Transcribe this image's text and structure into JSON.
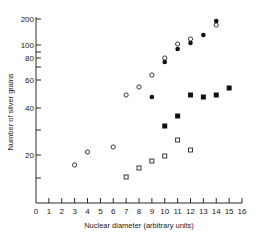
{
  "chart_data": {
    "type": "scatter",
    "title": "",
    "xlabel": "Nuclear diameter (arbitrary units)",
    "ylabel": "Number of silver grains",
    "xlim": [
      0,
      16
    ],
    "x_ticks": [
      0,
      1,
      2,
      3,
      4,
      5,
      6,
      7,
      8,
      9,
      10,
      11,
      12,
      13,
      14,
      15,
      16
    ],
    "y_tick_labels": [
      "200",
      "100",
      "80",
      "60",
      "40",
      "20"
    ],
    "y_ticks": [
      200,
      100,
      90,
      80,
      70,
      60,
      40,
      30,
      20,
      10
    ],
    "yscale": "non-linear (log-like)",
    "grid": false,
    "legend": null,
    "series": [
      {
        "name": "open-circles",
        "marker": "open-circle",
        "x": [
          3,
          4,
          6,
          7,
          8,
          9,
          10,
          11,
          12,
          14
        ],
        "y": [
          16,
          21,
          23,
          49,
          55,
          64,
          80,
          100,
          120,
          160
        ]
      },
      {
        "name": "filled-circles",
        "marker": "filled-circle",
        "x": [
          9,
          10,
          11,
          12,
          13,
          14
        ],
        "y": [
          47,
          76,
          95,
          105,
          125,
          180
        ]
      },
      {
        "name": "open-squares",
        "marker": "open-square",
        "x": [
          7,
          8,
          9,
          10,
          11,
          12
        ],
        "y": [
          11,
          15,
          18,
          20,
          26,
          22
        ]
      },
      {
        "name": "filled-squares",
        "marker": "filled-square",
        "x": [
          10,
          11,
          12,
          13,
          14,
          15
        ],
        "y": [
          32,
          37,
          49,
          47,
          49,
          54
        ]
      }
    ]
  },
  "layout": {
    "x0_px": 36,
    "x16_px": 242,
    "axis_y_px": 203,
    "axis_top_px": 17,
    "y_tick_px": {
      "200": 19,
      "100": 45,
      "90": 52,
      "80": 58,
      "70": 67,
      "60": 80,
      "40": 108,
      "30": 130,
      "20": 155,
      "10": 178,
      "0": 203
    },
    "points_px": {
      "open-circles": [
        [
          3,
          165
        ],
        [
          4,
          152
        ],
        [
          6,
          147
        ],
        [
          7,
          95
        ],
        [
          8,
          87
        ],
        [
          9,
          75
        ],
        [
          10,
          58
        ],
        [
          11,
          44
        ],
        [
          12,
          39
        ],
        [
          14,
          25
        ]
      ],
      "filled-circles": [
        [
          9,
          97
        ],
        [
          10,
          62
        ],
        [
          11,
          49
        ],
        [
          12,
          43
        ],
        [
          13,
          35
        ],
        [
          14,
          21
        ]
      ],
      "open-squares": [
        [
          7,
          177
        ],
        [
          8,
          168
        ],
        [
          9,
          161
        ],
        [
          10,
          156
        ],
        [
          11,
          140
        ],
        [
          12,
          150
        ]
      ],
      "filled-squares": [
        [
          10,
          126
        ],
        [
          11,
          116
        ],
        [
          12,
          95
        ],
        [
          13,
          97
        ],
        [
          14,
          95
        ],
        [
          15,
          88
        ]
      ]
    }
  },
  "labels": {
    "xlabel": "Nuclear diameter (arbitrary units)",
    "ylabel": "Number of silver grains"
  }
}
